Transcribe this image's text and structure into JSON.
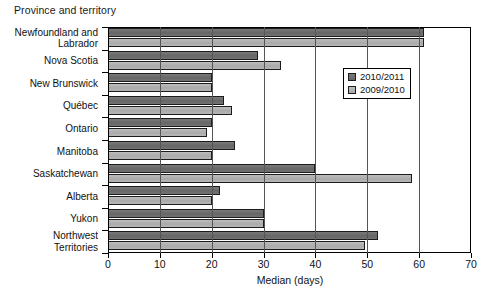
{
  "chart_data": {
    "type": "bar",
    "orientation": "horizontal",
    "title": "Province and territory",
    "xlabel": "Median (days)",
    "ylabel": "",
    "xlim": [
      0,
      70
    ],
    "xticks": [
      0,
      10,
      20,
      30,
      40,
      50,
      60,
      70
    ],
    "xticklabels": [
      "0",
      "10",
      "20",
      "30",
      "40",
      "50",
      "60",
      "70"
    ],
    "grid": true,
    "legend_position": "upper right",
    "categories": [
      "Newfoundland and Labrador",
      "Nova Scotia",
      "New Brunswick",
      "Québec",
      "Ontario",
      "Manitoba",
      "Saskatchewan",
      "Alberta",
      "Yukon",
      "Northwest Territories"
    ],
    "category_label_lines": [
      [
        "Newfoundland and",
        "Labrador"
      ],
      [
        "Nova Scotia"
      ],
      [
        "New Brunswick"
      ],
      [
        "Québec"
      ],
      [
        "Ontario"
      ],
      [
        "Manitoba"
      ],
      [
        "Saskatchewan"
      ],
      [
        "Alberta"
      ],
      [
        "Yukon"
      ],
      [
        "Northwest",
        "Territories"
      ]
    ],
    "series": [
      {
        "name": "2010/2011",
        "color": "#6e6e6e",
        "values": [
          61,
          29,
          20,
          22.4,
          20,
          24.5,
          40,
          21.6,
          30,
          52
        ]
      },
      {
        "name": "2009/2010",
        "color": "#b2b2b2",
        "values": [
          61,
          33.4,
          20,
          24,
          19,
          20,
          58.6,
          20,
          30,
          49.5
        ]
      }
    ]
  },
  "legend": {
    "entries": [
      {
        "label": "2010/2011"
      },
      {
        "label": "2009/2010"
      }
    ]
  },
  "colors": {
    "series_a": "#6e6e6e",
    "series_b": "#b2b2b2",
    "axis": "#000000",
    "background": "#ffffff"
  }
}
